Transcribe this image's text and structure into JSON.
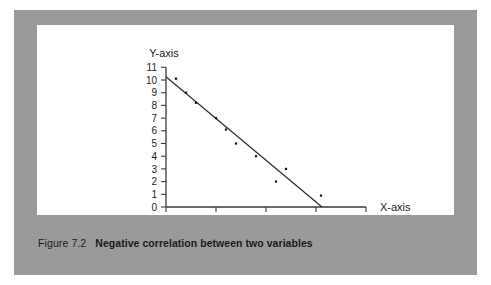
{
  "figure": {
    "caption_number": "Figure 7.2",
    "caption_text": "Negative correlation between two variables"
  },
  "colors": {
    "frame_gray": "#9a9a9a",
    "card_white": "#ffffff",
    "ink": "#1c1c1c",
    "axis": "#3a3a3a",
    "trendline": "#2b2b2b",
    "point": "#111111"
  },
  "chart_data": {
    "type": "scatter",
    "title": "",
    "subtitle": "",
    "xlabel": "X-axis",
    "ylabel": "Y-axis",
    "xlim": [
      0,
      20
    ],
    "ylim": [
      0,
      11
    ],
    "grid": false,
    "legend": null,
    "x_ticks": [
      0,
      5,
      10,
      15,
      20
    ],
    "x_tick_labels": [
      "0",
      "",
      "10",
      "",
      "20"
    ],
    "y_ticks": [
      0,
      1,
      2,
      3,
      4,
      5,
      6,
      7,
      8,
      9,
      10,
      11
    ],
    "y_tick_labels": [
      "0",
      "1",
      "2",
      "3",
      "4",
      "5",
      "6",
      "7",
      "8",
      "9",
      "10",
      "11"
    ],
    "points": [
      {
        "x": 1.0,
        "y": 10.1
      },
      {
        "x": 2.0,
        "y": 9.0
      },
      {
        "x": 3.0,
        "y": 8.2
      },
      {
        "x": 5.0,
        "y": 7.0
      },
      {
        "x": 6.0,
        "y": 6.1
      },
      {
        "x": 7.0,
        "y": 5.0
      },
      {
        "x": 9.0,
        "y": 4.0
      },
      {
        "x": 12.0,
        "y": 3.0
      },
      {
        "x": 11.0,
        "y": 2.0
      },
      {
        "x": 15.5,
        "y": 0.9
      }
    ],
    "trendline": {
      "x0": 0.0,
      "y0": 10.25,
      "x1": 15.6,
      "y1": 0.0
    },
    "annotations": []
  }
}
